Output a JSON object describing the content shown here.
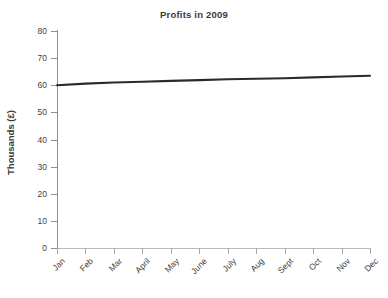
{
  "chart_data": {
    "type": "line",
    "title": "Profits in 2009",
    "xlabel": "",
    "ylabel": "Thousands (£)",
    "categories": [
      "Jan",
      "Feb",
      "Mar",
      "April",
      "May",
      "June",
      "July",
      "Aug",
      "Sept",
      "Oct",
      "Nov",
      "Dec"
    ],
    "series": [
      {
        "name": "Profits",
        "values": [
          60.0,
          60.6,
          61.0,
          61.3,
          61.6,
          61.9,
          62.2,
          62.4,
          62.6,
          62.9,
          63.2,
          63.5
        ],
        "color": "#2a2a2a"
      }
    ],
    "ylim": [
      0,
      80
    ],
    "yticks": [
      0,
      10,
      20,
      30,
      40,
      50,
      60,
      70,
      80
    ],
    "ytick_labels": [
      "0",
      "10",
      "20",
      "30",
      "40",
      "50",
      "60",
      "70",
      "80"
    ],
    "grid": false,
    "legend": "none",
    "marker": "none",
    "xtick_label_rotation": -45
  },
  "colors": {
    "background": "#ffffff",
    "axis": "#8d8d8d",
    "x_axis": "#b9b9b9",
    "text": "#3a3a3a",
    "series": "#2a2a2a"
  }
}
